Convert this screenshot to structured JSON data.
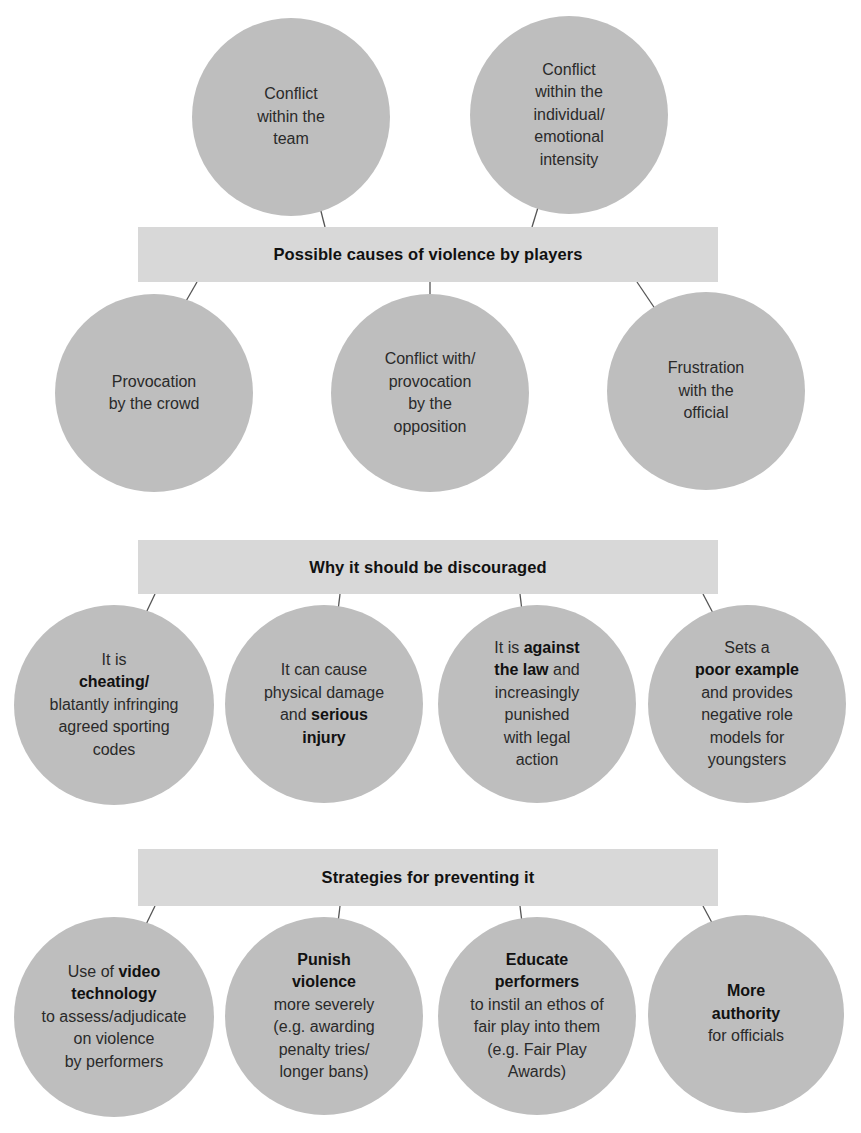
{
  "diagram": {
    "colors": {
      "banner": "#d8d8d8",
      "circle": "#bebebe",
      "arrow": "#555555"
    },
    "sections": [
      {
        "title": "Possible causes of violence by players",
        "items_above": [
          {
            "parts": [
              {
                "text": "Conflict within the team",
                "bold": false
              }
            ]
          },
          {
            "parts": [
              {
                "text": "Conflict within the individual/ emotional intensity",
                "bold": false
              }
            ]
          }
        ],
        "items": [
          {
            "parts": [
              {
                "text": "Provocation by the crowd",
                "bold": false
              }
            ]
          },
          {
            "parts": [
              {
                "text": "Conflict with/ provocation by the opposition",
                "bold": false
              }
            ]
          },
          {
            "parts": [
              {
                "text": "Frustration with the official",
                "bold": false
              }
            ]
          }
        ]
      },
      {
        "title": "Why it should be discouraged",
        "items": [
          {
            "parts": [
              {
                "text": "It is ",
                "bold": false
              },
              {
                "text": "cheating/",
                "bold": true
              },
              {
                "text": " blatantly infringing agreed sporting codes",
                "bold": false
              }
            ]
          },
          {
            "parts": [
              {
                "text": "It can cause physical damage and ",
                "bold": false
              },
              {
                "text": "serious injury",
                "bold": true
              }
            ]
          },
          {
            "parts": [
              {
                "text": "It is ",
                "bold": false
              },
              {
                "text": "against the law",
                "bold": true
              },
              {
                "text": " and increasingly punished with legal action",
                "bold": false
              }
            ]
          },
          {
            "parts": [
              {
                "text": "Sets a ",
                "bold": false
              },
              {
                "text": "poor example",
                "bold": true
              },
              {
                "text": " and provides negative role models for youngsters",
                "bold": false
              }
            ]
          }
        ]
      },
      {
        "title": "Strategies for preventing it",
        "items": [
          {
            "parts": [
              {
                "text": "Use of ",
                "bold": false
              },
              {
                "text": "video technology",
                "bold": true
              },
              {
                "text": " to assess/adjudicate on violence by performers",
                "bold": false
              }
            ]
          },
          {
            "parts": [
              {
                "text": "Punish violence",
                "bold": true
              },
              {
                "text": " more severely (e.g. awarding penalty tries/ longer bans)",
                "bold": false
              }
            ]
          },
          {
            "parts": [
              {
                "text": "Educate performers",
                "bold": true
              },
              {
                "text": " to instil an ethos of fair play into them (e.g. Fair Play Awards)",
                "bold": false
              }
            ]
          },
          {
            "parts": [
              {
                "text": "More authority",
                "bold": true
              },
              {
                "text": " for officials",
                "bold": false
              }
            ]
          }
        ]
      }
    ],
    "lines": {
      "s1_above_0": [
        "Conflict",
        "within the",
        "team"
      ],
      "s1_above_1": [
        "Conflict",
        "within the",
        "individual/",
        "emotional",
        "intensity"
      ],
      "s1_0": [
        "Provocation",
        "by the crowd"
      ],
      "s1_1": [
        "Conflict with/",
        "provocation",
        "by the",
        "opposition"
      ],
      "s1_2": [
        "Frustration",
        "with the",
        "official"
      ],
      "s2_0": [
        [
          "It is"
        ],
        [
          [
            "b",
            "cheating/"
          ]
        ],
        [
          "blatantly infringing"
        ],
        [
          "agreed sporting"
        ],
        [
          "codes"
        ]
      ],
      "s2_1": [
        [
          "It can cause"
        ],
        [
          "physical damage"
        ],
        [
          "and ",
          [
            "b",
            "serious"
          ]
        ],
        [
          [
            "b",
            "injury"
          ]
        ]
      ],
      "s2_2": [
        [
          "It is ",
          [
            "b",
            "against"
          ]
        ],
        [
          [
            "b",
            "the law"
          ],
          " and"
        ],
        [
          "increasingly"
        ],
        [
          "punished"
        ],
        [
          "with legal"
        ],
        [
          "action"
        ]
      ],
      "s2_3": [
        [
          "Sets a"
        ],
        [
          [
            "b",
            "poor example"
          ]
        ],
        [
          "and provides"
        ],
        [
          "negative role"
        ],
        [
          "models for"
        ],
        [
          "youngsters"
        ]
      ],
      "s3_0": [
        [
          "Use of ",
          [
            "b",
            "video"
          ]
        ],
        [
          [
            "b",
            "technology"
          ]
        ],
        [
          "to assess/adjudicate"
        ],
        [
          "on violence"
        ],
        [
          "by performers"
        ]
      ],
      "s3_1": [
        [
          [
            "b",
            "Punish"
          ]
        ],
        [
          [
            "b",
            "violence"
          ]
        ],
        [
          "more severely"
        ],
        [
          "(e.g. awarding"
        ],
        [
          "penalty tries/"
        ],
        [
          "longer bans)"
        ]
      ],
      "s3_2": [
        [
          [
            "b",
            "Educate"
          ]
        ],
        [
          [
            "b",
            "performers"
          ]
        ],
        [
          "to instil an ethos of"
        ],
        [
          "fair play into them"
        ],
        [
          "(e.g. Fair Play"
        ],
        [
          "Awards)"
        ]
      ],
      "s3_3": [
        [
          [
            "b",
            "More"
          ]
        ],
        [
          [
            "b",
            "authority"
          ]
        ],
        [
          "for officials"
        ]
      ]
    }
  }
}
